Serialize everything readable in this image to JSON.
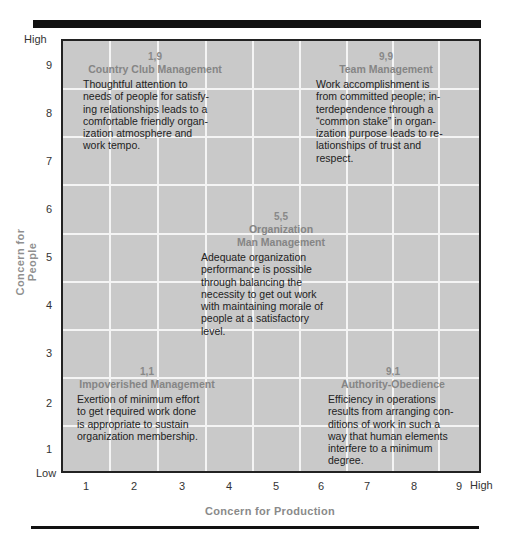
{
  "chart": {
    "y_axis": {
      "title": "Concern for People",
      "high_label": "High",
      "low_label": "Low",
      "ticks": [
        "9",
        "8",
        "7",
        "6",
        "5",
        "4",
        "3",
        "2",
        "1"
      ]
    },
    "x_axis": {
      "title": "Concern for Production",
      "high_label": "High",
      "ticks": [
        "1",
        "2",
        "3",
        "4",
        "5",
        "6",
        "7",
        "8",
        "9"
      ]
    },
    "styles": [
      {
        "coord": "1,9",
        "name": "Country Club Management",
        "description": "Thoughtful attention to needs of people for satisfy-ing relationships leads to a comfortable friendly organ-ization atmosphere and work tempo.",
        "lines": [
          "Thoughtful attention to",
          "needs of people for satisfy-",
          "ing relationships leads to a",
          "comfortable friendly organ-",
          "ization atmosphere and",
          "work tempo."
        ]
      },
      {
        "coord": "9,9",
        "name": "Team Management",
        "lines": [
          "Work accomplishment is",
          "from committed people; in-",
          "terdependence through a",
          "“common stake” in organ-",
          "ization purpose leads to re-",
          "lationships of trust and",
          "respect."
        ]
      },
      {
        "coord": "5,5",
        "name_line1": "Organization",
        "name_line2": "Man Management",
        "lines": [
          "Adequate organization",
          "performance is possible",
          "through balancing the",
          "necessity to get out work",
          "with maintaining morale of",
          "people at a satisfactory",
          "level."
        ]
      },
      {
        "coord": "1,1",
        "name": "Impoverished Management",
        "lines": [
          "Exertion of minimum effort",
          "to get required work done",
          "is appropriate to sustain",
          "organization membership."
        ]
      },
      {
        "coord": "9,1",
        "name": "Authority-Obedience",
        "lines": [
          "Efficiency in operations",
          "results from arranging con-",
          "ditions of work in such a",
          "way that human elements",
          "interfere to a minimum",
          "degree."
        ]
      }
    ]
  },
  "colors": {
    "grid_fill": "#c9c9c9",
    "grid_lines": "#f4f4f4",
    "border": "#222222",
    "label_gray": "#888888"
  }
}
